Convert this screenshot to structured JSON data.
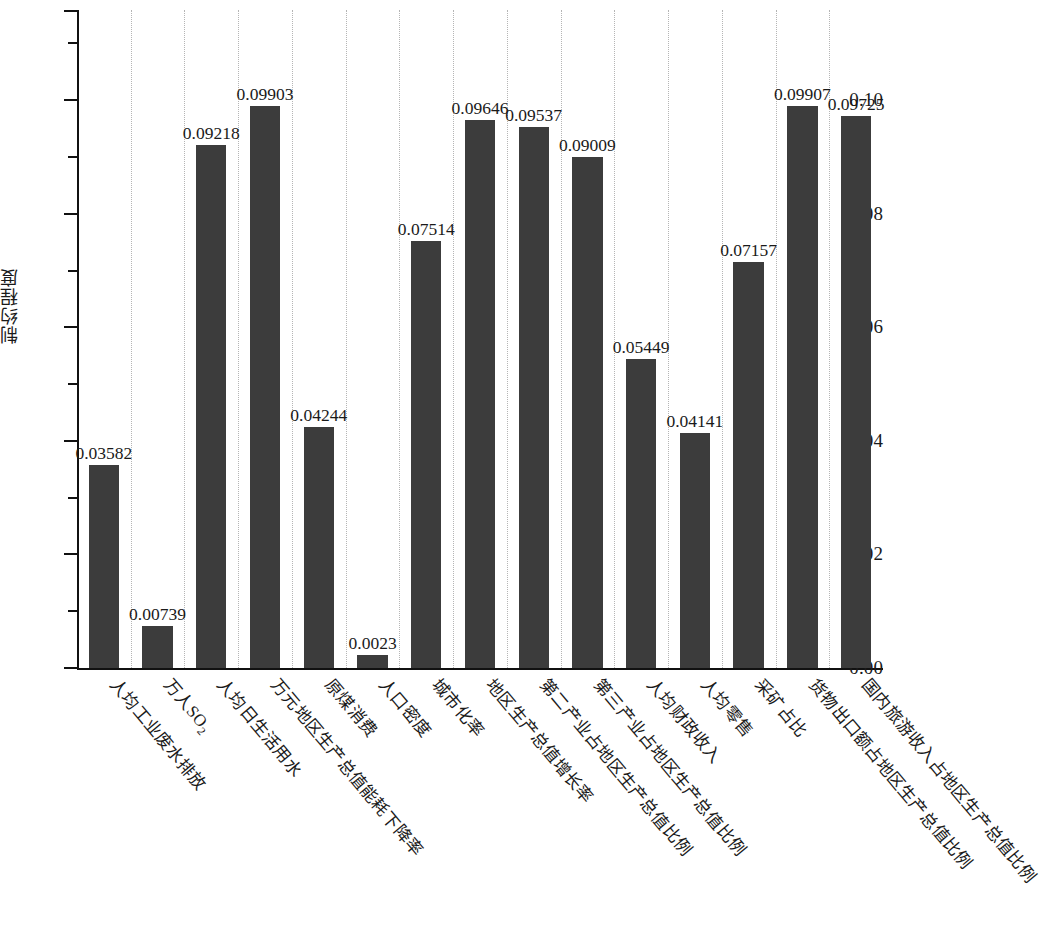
{
  "chart_data": {
    "type": "bar",
    "title": "",
    "subtitle": "",
    "xlabel": "",
    "ylabel": "制约程度",
    "ylim": [
      0.0,
      0.1159
    ],
    "grid": "vertical dotted gridlines between categories",
    "legend": "none",
    "bar_color": "#3c3c3c",
    "axis_color": "#111111",
    "gridline_color": "#b5b5b5",
    "ytick_labels": [
      "0.00",
      "0.02",
      "0.04",
      "0.06",
      "0.08",
      "0.10"
    ],
    "ytick_values": [
      0.0,
      0.02,
      0.04,
      0.06,
      0.08,
      0.1
    ],
    "yminor_values": [
      0.01,
      0.03,
      0.05,
      0.07,
      0.09,
      0.11
    ],
    "categories": [
      "人均工业废水排放",
      "万人SO2",
      "人均日生活用水",
      "万元地区生产总值能耗下降率",
      "原煤消费",
      "人口密度",
      "城市化率",
      "地区生产总值增长率",
      "第二产业占地区生产总值比例",
      "第三产业占地区生产总值比例",
      "人均财政收入",
      "人均零售",
      "采矿占比",
      "货物出口额占地区生产总值比例",
      "国内旅游收入占地区生产总值比例"
    ],
    "values": [
      0.03582,
      0.00739,
      0.09218,
      0.09903,
      0.04244,
      0.0023,
      0.07514,
      0.09646,
      0.09537,
      0.09009,
      0.05449,
      0.04141,
      0.07157,
      0.09907,
      0.09725
    ],
    "value_labels": [
      "0.03582",
      "0.00739",
      "0.09218",
      "0.09903",
      "0.04244",
      "0.0023",
      "0.07514",
      "0.09646",
      "0.09537",
      "0.09009",
      "0.05449",
      "0.04141",
      "0.07157",
      "0.09907",
      "0.09725"
    ]
  }
}
